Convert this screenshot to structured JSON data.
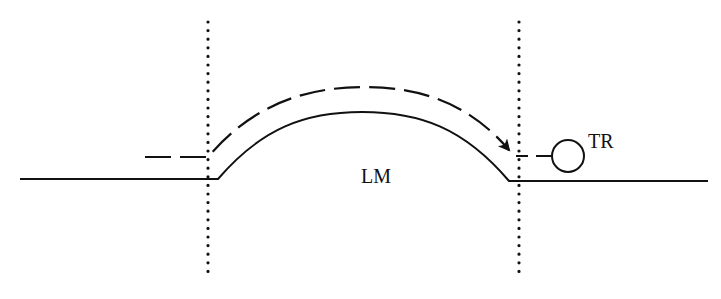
{
  "diagram": {
    "labels": {
      "middle_region": "LM",
      "right_region": "TR"
    },
    "elements": {
      "boundaries": [
        "left-boundary",
        "right-boundary"
      ],
      "path_style": "dashed",
      "surface_style": "solid",
      "endpoint_marker": "circle",
      "arrow_direction": "left-to-right"
    },
    "colors": {
      "ink": "#111111",
      "background": "#ffffff"
    }
  }
}
